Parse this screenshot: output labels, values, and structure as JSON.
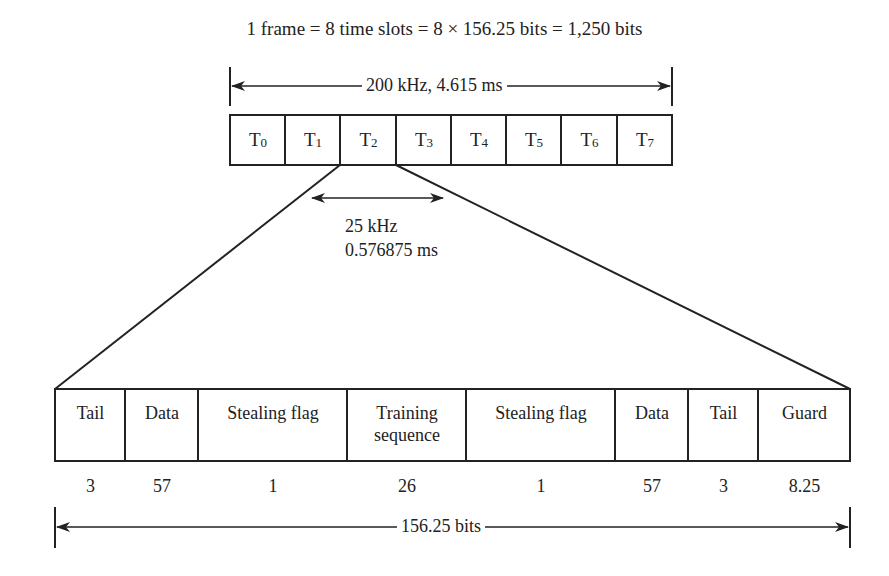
{
  "diagram": {
    "title": "1 frame = 8 time slots = 8 × 156.25 bits = 1,250 bits",
    "frame": {
      "span_label": "200 kHz, 4.615 ms",
      "slots": [
        {
          "name": "T",
          "sub": "0"
        },
        {
          "name": "T",
          "sub": "1"
        },
        {
          "name": "T",
          "sub": "2"
        },
        {
          "name": "T",
          "sub": "3"
        },
        {
          "name": "T",
          "sub": "4"
        },
        {
          "name": "T",
          "sub": "5"
        },
        {
          "name": "T",
          "sub": "6"
        },
        {
          "name": "T",
          "sub": "7"
        }
      ]
    },
    "slot_detail": {
      "bandwidth": "25 kHz",
      "duration": "0.576875 ms"
    },
    "burst": {
      "fields": [
        {
          "label": "Tail",
          "bits": "3"
        },
        {
          "label": "Data",
          "bits": "57"
        },
        {
          "label": "Stealing flag",
          "bits": "1"
        },
        {
          "label": "Training sequence",
          "bits": "26"
        },
        {
          "label": "Stealing flag",
          "bits": "1"
        },
        {
          "label": "Data",
          "bits": "57"
        },
        {
          "label": "Tail",
          "bits": "3"
        },
        {
          "label": "Guard",
          "bits": "8.25"
        }
      ],
      "span_label": "156.25 bits"
    }
  }
}
